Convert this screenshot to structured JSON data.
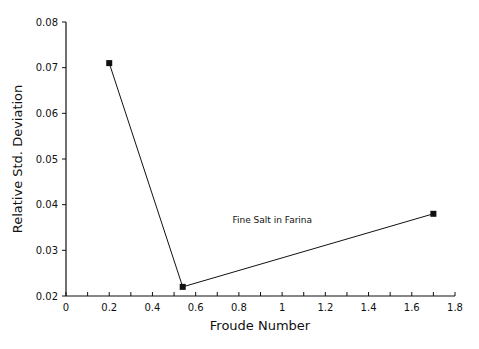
{
  "chart_data": {
    "type": "line",
    "title": "",
    "xlabel": "Froude Number",
    "ylabel": "Relative Std. Deviation",
    "xlim": [
      0,
      1.8
    ],
    "ylim": [
      0.02,
      0.08
    ],
    "x_ticks": [
      "0",
      "0.2",
      "0.4",
      "0.6",
      "0.8",
      "1",
      "1.2",
      "1.4",
      "1.6",
      "1.8"
    ],
    "y_ticks": [
      "0.02",
      "0.03",
      "0.04",
      "0.05",
      "0.06",
      "0.07",
      "0.08"
    ],
    "grid": false,
    "series": [
      {
        "name": "Fine Salt in Farina",
        "x": [
          0.2,
          0.54,
          1.7
        ],
        "values": [
          0.071,
          0.022,
          0.038
        ],
        "marker": "square"
      }
    ],
    "annotations": [
      {
        "text": "Fine Salt in Farina",
        "x": 0.9,
        "y": 0.036
      }
    ]
  }
}
